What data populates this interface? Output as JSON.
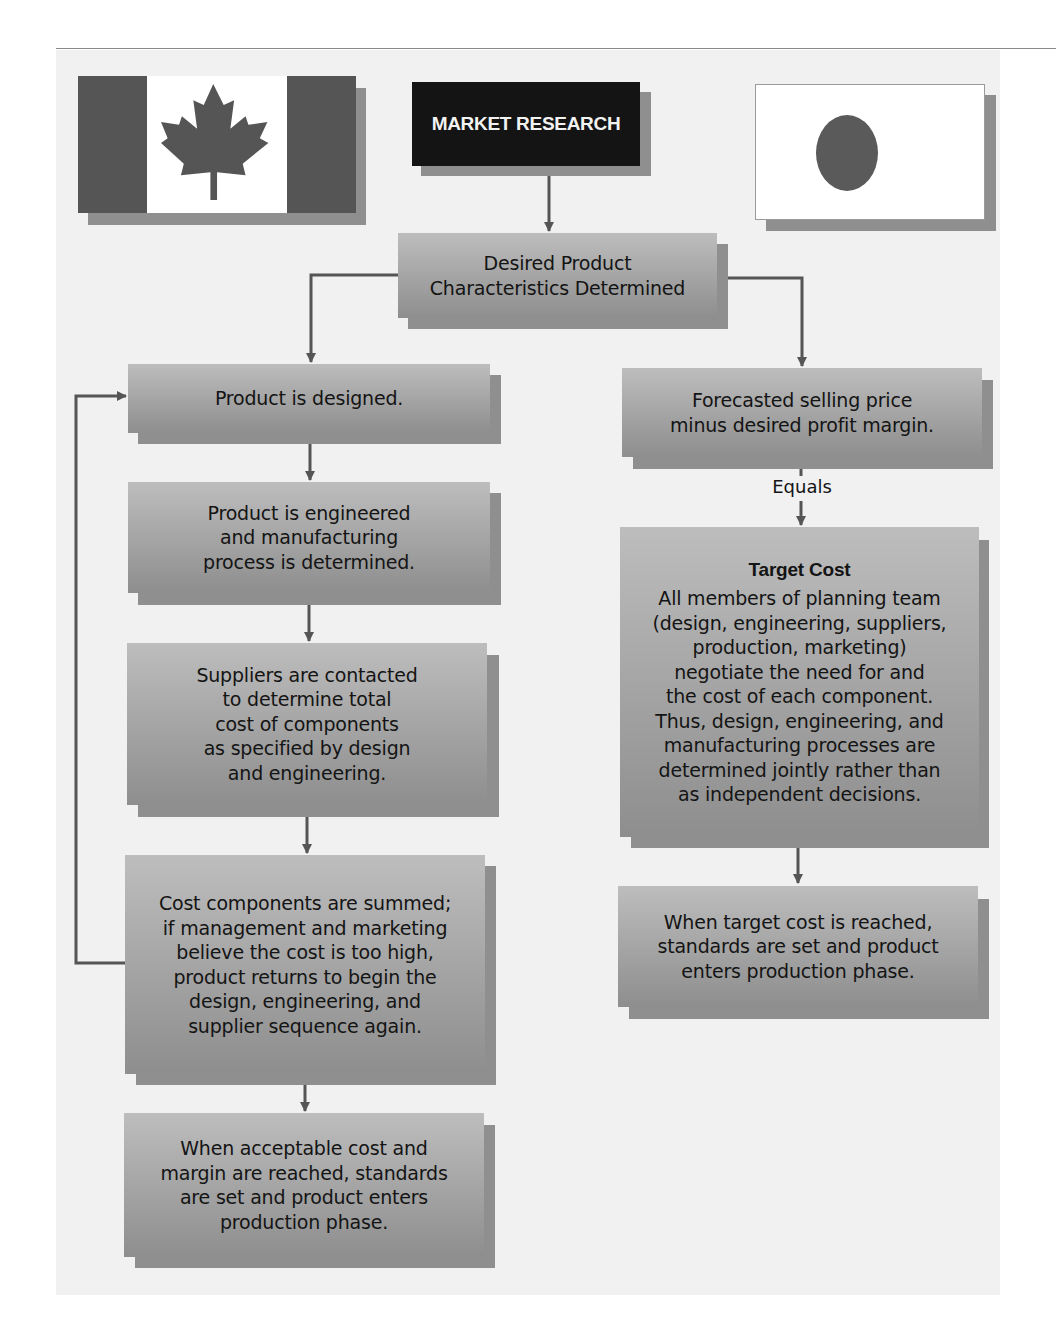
{
  "header": {
    "title_box": "MARKET RESEARCH",
    "left_flag": "canada-flag-icon",
    "right_flag": "japan-flag-icon"
  },
  "top_node": {
    "lines": [
      "Desired Product",
      "Characteristics Determined"
    ]
  },
  "left_column": {
    "label": "Traditional cost approach (Canada)",
    "nodes": [
      {
        "lines": [
          "Product is designed."
        ]
      },
      {
        "lines": [
          "Product is engineered",
          "and manufacturing",
          "process is determined."
        ]
      },
      {
        "lines": [
          "Suppliers are contacted",
          "to determine total",
          "cost of components",
          "as specified by design",
          "and engineering."
        ]
      },
      {
        "lines": [
          "Cost components are summed;",
          "if management and marketing",
          "believe the cost is too high,",
          "product returns to begin the",
          "design, engineering, and",
          "supplier sequence again."
        ]
      },
      {
        "lines": [
          "When acceptable cost and",
          "margin are reached, standards",
          "are set and product enters",
          "production phase."
        ]
      }
    ],
    "feedback_loop": "Cost too high returns to Product is designed."
  },
  "right_column": {
    "label": "Target cost approach (Japan)",
    "nodes": [
      {
        "lines": [
          "Forecasted selling price",
          "minus desired profit margin."
        ]
      },
      {
        "title": "Target Cost",
        "lines": [
          "All members of planning team",
          "(design, engineering, suppliers,",
          "production, marketing)",
          "negotiate the need for and",
          "the cost of each component.",
          "Thus, design, engineering, and",
          "manufacturing processes are",
          "determined jointly rather than",
          "as independent decisions."
        ]
      },
      {
        "lines": [
          "When target cost is reached,",
          "standards are set and product",
          "enters production phase."
        ]
      }
    ],
    "connector_label": "Equals"
  },
  "colors": {
    "panel_bg": "#f1f1f1",
    "box_gradient_top": "#bdbdbd",
    "box_gradient_bottom": "#8e8e8e",
    "box_shadow": "#8f8f8f",
    "title_box_bg": "#141414",
    "connector": "#555555"
  }
}
